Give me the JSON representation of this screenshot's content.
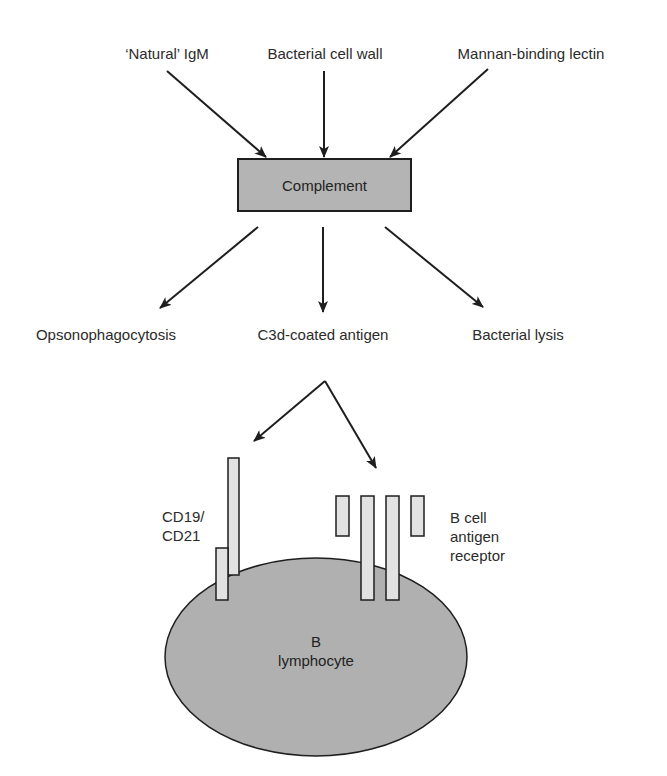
{
  "diagram": {
    "inputs": [
      {
        "label": "‘Natural’ IgM"
      },
      {
        "label": "Bacterial cell wall"
      },
      {
        "label": "Mannan-binding lectin"
      }
    ],
    "center_node": {
      "label": "Complement"
    },
    "outputs": [
      {
        "label": "Opsonophagocytosis"
      },
      {
        "label": "C3d-coated antigen"
      },
      {
        "label": "Bacterial lysis"
      }
    ],
    "receptors": {
      "cd19_cd21": {
        "line1": "CD19/",
        "line2": "CD21"
      },
      "bcr": {
        "line1": "B cell",
        "line2": "antigen",
        "line3": "receptor"
      }
    },
    "cell": {
      "line1": "B",
      "line2": "lymphocyte"
    },
    "colors": {
      "box_fill": "#b4b4b4",
      "cell_fill": "#b0b0b0",
      "receptor_fill": "#e2e2e2",
      "stroke": "#1e1e1e"
    }
  }
}
